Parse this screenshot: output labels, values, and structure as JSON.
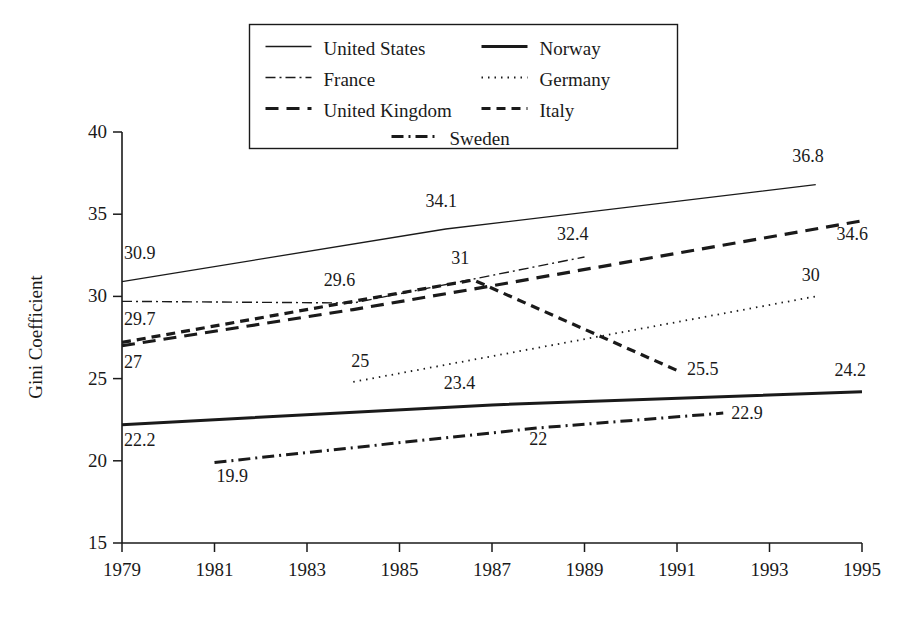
{
  "chart_data": {
    "type": "line",
    "title": "",
    "xlabel": "",
    "ylabel": "Gini Coefficient",
    "xlim": [
      1979,
      1995
    ],
    "ylim": [
      15,
      40
    ],
    "xticks": [
      1979,
      1981,
      1983,
      1985,
      1987,
      1989,
      1991,
      1993,
      1995
    ],
    "yticks": [
      15,
      20,
      25,
      30,
      35,
      40
    ],
    "grid": false,
    "legend_position": "top-center",
    "series": [
      {
        "name": "United States",
        "style": "solid-thin",
        "stroke_width": 1.3,
        "dash": "none",
        "x": [
          1979,
          1986,
          1994
        ],
        "y": [
          30.9,
          34.1,
          36.8
        ],
        "labels": [
          {
            "text": "30.9",
            "x": 1979.0,
            "y": 31.9,
            "anchor": "start",
            "dx": 2,
            "dy": -6
          },
          {
            "text": "34.1",
            "x": 1985.9,
            "y": 35.1,
            "anchor": "middle",
            "dx": 0,
            "dy": -6
          },
          {
            "text": "36.8",
            "x": 1994.0,
            "y": 37.8,
            "anchor": "end",
            "dx": 8,
            "dy": -6
          }
        ]
      },
      {
        "name": "France",
        "style": "dash-dot-thin",
        "stroke_width": 1.4,
        "dash": "10,4,2,4",
        "x": [
          1979,
          1984,
          1989
        ],
        "y": [
          29.7,
          29.6,
          32.4
        ],
        "labels": [
          {
            "text": "29.7",
            "x": 1979.0,
            "y": 28.6,
            "anchor": "start",
            "dx": 2,
            "dy": 6
          },
          {
            "text": "29.6",
            "x": 1984.0,
            "y": 30.4,
            "anchor": "end",
            "dx": 2,
            "dy": -4
          },
          {
            "text": "32.4",
            "x": 1989.0,
            "y": 33.1,
            "anchor": "end",
            "dx": 4,
            "dy": -5
          }
        ]
      },
      {
        "name": "United Kingdom",
        "style": "dash-heavy",
        "stroke_width": 3.2,
        "dash": "13,8",
        "x": [
          1979,
          1984,
          1986.5,
          1995
        ],
        "y": [
          27.0,
          29.2,
          30.4,
          34.6
        ],
        "labels": [
          {
            "text": "27",
            "x": 1979.0,
            "y": 26.0,
            "anchor": "start",
            "dx": 2,
            "dy": 6
          },
          {
            "text": "34.6",
            "x": 1995.0,
            "y": 33.8,
            "anchor": "end",
            "dx": 6,
            "dy": 6
          }
        ]
      },
      {
        "name": "Italy",
        "style": "dot-dash-heavy",
        "stroke_width": 3.2,
        "dash": "9,6",
        "x": [
          1979,
          1986.6,
          1991
        ],
        "y": [
          27.2,
          31.0,
          25.5
        ],
        "labels": [
          {
            "text": "31",
            "x": 1986.4,
            "y": 31.6,
            "anchor": "middle",
            "dx": -4,
            "dy": -6
          },
          {
            "text": "25.5",
            "x": 1991.0,
            "y": 25.5,
            "anchor": "start",
            "dx": 10,
            "dy": 5
          }
        ]
      },
      {
        "name": "Germany",
        "style": "dotted",
        "stroke_width": 1.8,
        "dash": "1.5,5",
        "x": [
          1984,
          1994
        ],
        "y": [
          24.8,
          30.0
        ],
        "labels": [
          {
            "text": "25",
            "x": 1984.0,
            "y": 25.4,
            "anchor": "start",
            "dx": -2,
            "dy": -5
          },
          {
            "text": "30",
            "x": 1994.0,
            "y": 30.6,
            "anchor": "end",
            "dx": 4,
            "dy": -6
          }
        ]
      },
      {
        "name": "Norway",
        "style": "solid-heavy",
        "stroke_width": 3.0,
        "dash": "none",
        "x": [
          1979,
          1987,
          1995
        ],
        "y": [
          22.2,
          23.4,
          24.2
        ],
        "labels": [
          {
            "text": "22.2",
            "x": 1979.0,
            "y": 21.4,
            "anchor": "start",
            "dx": 2,
            "dy": 8
          },
          {
            "text": "23.4",
            "x": 1986.3,
            "y": 24.0,
            "anchor": "middle",
            "dx": 0,
            "dy": -6
          },
          {
            "text": "24.2",
            "x": 1995.0,
            "y": 24.8,
            "anchor": "end",
            "dx": 4,
            "dy": -6
          }
        ]
      },
      {
        "name": "Sweden",
        "style": "dash-dot-heavy",
        "stroke_width": 3.0,
        "dash": "12,5,2,5",
        "x": [
          1981,
          1988,
          1992
        ],
        "y": [
          19.9,
          22.0,
          22.9
        ],
        "labels": [
          {
            "text": "19.9",
            "x": 1981.0,
            "y": 19.3,
            "anchor": "start",
            "dx": 2,
            "dy": 10
          },
          {
            "text": "22",
            "x": 1988.0,
            "y": 21.6,
            "anchor": "middle",
            "dx": 0,
            "dy": 10
          },
          {
            "text": "22.9",
            "x": 1992.0,
            "y": 22.9,
            "anchor": "start",
            "dx": 8,
            "dy": 6
          }
        ]
      }
    ],
    "legend": {
      "entries": [
        {
          "label": "United States",
          "col": 0,
          "row": 0,
          "dash": "none",
          "stroke_width": 1.3
        },
        {
          "label": "Norway",
          "col": 1,
          "row": 0,
          "dash": "none",
          "stroke_width": 3.0
        },
        {
          "label": "France",
          "col": 0,
          "row": 1,
          "dash": "10,4,2,4",
          "stroke_width": 1.4
        },
        {
          "label": "Germany",
          "col": 1,
          "row": 1,
          "dash": "1.5,5",
          "stroke_width": 1.8
        },
        {
          "label": "United Kingdom",
          "col": 0,
          "row": 2,
          "dash": "13,8",
          "stroke_width": 3.2
        },
        {
          "label": "Italy",
          "col": 1,
          "row": 2,
          "dash": "9,6",
          "stroke_width": 3.2
        },
        {
          "label": "Sweden",
          "col": 2,
          "row": 3,
          "dash": "12,5,2,5",
          "stroke_width": 3.0
        }
      ]
    }
  }
}
